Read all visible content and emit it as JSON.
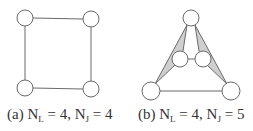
{
  "colors": {
    "stroke": "#6a6a6a",
    "node_fill": "#ffffff",
    "wedge_fill": "#cfcfcf",
    "text": "#333333"
  },
  "diagrams": [
    {
      "id": "a",
      "caption": {
        "label": "(a)",
        "n_l_symbol": "N",
        "n_l_sub": "L",
        "n_l_value": "= 4,",
        "n_j_symbol": "N",
        "n_j_sub": "J",
        "n_j_value": "= 4"
      },
      "nodes": [
        {
          "name": "top-left",
          "x": 25,
          "y": 18,
          "r": 8
        },
        {
          "name": "top-right",
          "x": 91,
          "y": 19,
          "r": 8
        },
        {
          "name": "bottom-left",
          "x": 25,
          "y": 88,
          "r": 8
        },
        {
          "name": "bottom-right",
          "x": 91,
          "y": 89,
          "r": 8
        }
      ],
      "links": [
        [
          "top-left",
          "top-right"
        ],
        [
          "top-right",
          "bottom-right"
        ],
        [
          "bottom-right",
          "bottom-left"
        ],
        [
          "bottom-left",
          "top-left"
        ]
      ]
    },
    {
      "id": "b",
      "caption": {
        "label": "(b)",
        "n_l_symbol": "N",
        "n_l_sub": "L",
        "n_l_value": "= 4,",
        "n_j_symbol": "N",
        "n_j_sub": "J",
        "n_j_value": "= 5"
      },
      "nodes": [
        {
          "name": "top",
          "x": 191,
          "y": 18,
          "r": 8
        },
        {
          "name": "middle-left",
          "x": 180,
          "y": 59,
          "r": 8
        },
        {
          "name": "middle-right",
          "x": 203,
          "y": 59,
          "r": 8
        },
        {
          "name": "bottom-left",
          "x": 151,
          "y": 91,
          "r": 9
        },
        {
          "name": "bottom-right",
          "x": 231,
          "y": 91,
          "r": 9
        }
      ],
      "links": [
        [
          "bottom-left",
          "bottom-right"
        ],
        [
          "middle-left",
          "middle-right"
        ]
      ],
      "wedges": [
        {
          "name": "left-wedge",
          "points": "187,25 155,84 175,65 183,51"
        },
        {
          "name": "right-wedge",
          "points": "195,25 227,84 207,65 199,51"
        }
      ]
    }
  ]
}
